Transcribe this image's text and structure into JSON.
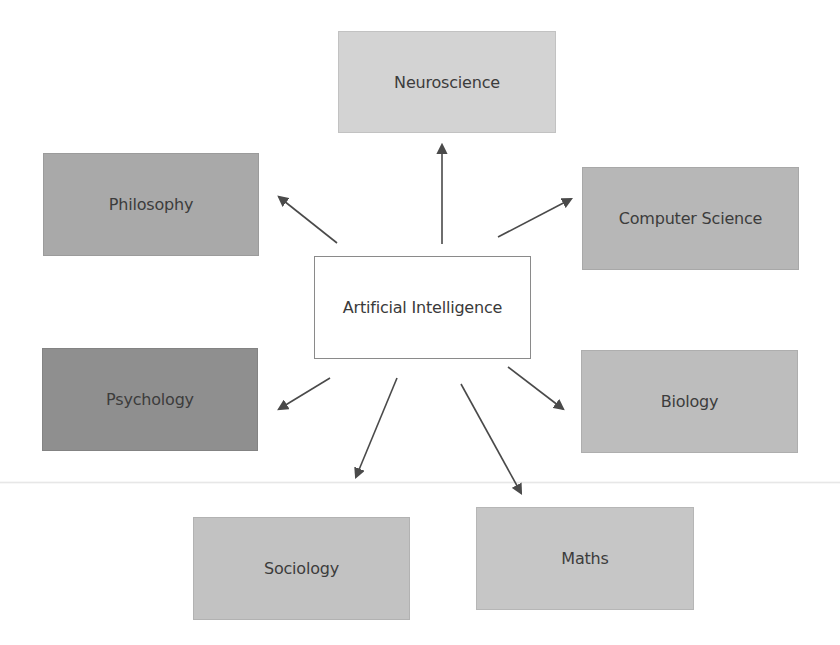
{
  "diagram": {
    "type": "hub-and-spoke",
    "center": {
      "label": "Artificial Intelligence",
      "box": {
        "x": 314,
        "y": 256,
        "w": 217,
        "h": 103
      },
      "fill": "#ffffff",
      "border": "#8a8a8a"
    },
    "nodes": [
      {
        "id": "neuroscience",
        "label": "Neuroscience",
        "box": {
          "x": 338,
          "y": 31,
          "w": 218,
          "h": 102
        },
        "fill": "#d3d3d3"
      },
      {
        "id": "philosophy",
        "label": "Philosophy",
        "box": {
          "x": 43,
          "y": 153,
          "w": 216,
          "h": 103
        },
        "fill": "#a9a9a9"
      },
      {
        "id": "computer-science",
        "label": "Computer Science",
        "box": {
          "x": 582,
          "y": 167,
          "w": 217,
          "h": 103
        },
        "fill": "#b7b7b7"
      },
      {
        "id": "psychology",
        "label": "Psychology",
        "box": {
          "x": 42,
          "y": 348,
          "w": 216,
          "h": 103
        },
        "fill": "#8f8f8f"
      },
      {
        "id": "biology",
        "label": "Biology",
        "box": {
          "x": 581,
          "y": 350,
          "w": 217,
          "h": 103
        },
        "fill": "#bdbdbd"
      },
      {
        "id": "sociology",
        "label": "Sociology",
        "box": {
          "x": 193,
          "y": 517,
          "w": 217,
          "h": 103
        },
        "fill": "#c2c2c2"
      },
      {
        "id": "maths",
        "label": "Maths",
        "box": {
          "x": 476,
          "y": 507,
          "w": 218,
          "h": 103
        },
        "fill": "#c6c6c6"
      }
    ],
    "edges": [
      {
        "from": "artificial-intelligence",
        "to": "neuroscience",
        "x1": 442,
        "y1": 244,
        "x2": 442,
        "y2": 145
      },
      {
        "from": "artificial-intelligence",
        "to": "philosophy",
        "x1": 337,
        "y1": 243,
        "x2": 279,
        "y2": 197
      },
      {
        "from": "artificial-intelligence",
        "to": "computer-science",
        "x1": 498,
        "y1": 237,
        "x2": 571,
        "y2": 199
      },
      {
        "from": "artificial-intelligence",
        "to": "psychology",
        "x1": 330,
        "y1": 378,
        "x2": 279,
        "y2": 409
      },
      {
        "from": "artificial-intelligence",
        "to": "biology",
        "x1": 508,
        "y1": 367,
        "x2": 563,
        "y2": 409
      },
      {
        "from": "artificial-intelligence",
        "to": "sociology",
        "x1": 397,
        "y1": 378,
        "x2": 356,
        "y2": 477
      },
      {
        "from": "artificial-intelligence",
        "to": "maths",
        "x1": 461,
        "y1": 384,
        "x2": 521,
        "y2": 493
      }
    ],
    "arrow_color": "#4a4a4a",
    "text_color": "#3c3c3c"
  }
}
